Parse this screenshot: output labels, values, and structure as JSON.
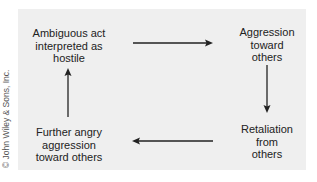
{
  "diagram": {
    "type": "cycle",
    "nodes": [
      {
        "id": "ambiguous",
        "lines": [
          "Ambiguous act",
          "interpreted as",
          "hostile"
        ]
      },
      {
        "id": "aggression",
        "lines": [
          "Aggression",
          "toward",
          "others"
        ]
      },
      {
        "id": "retaliation",
        "lines": [
          "Retaliation",
          "from",
          "others"
        ]
      },
      {
        "id": "further",
        "lines": [
          "Further angry",
          "aggression",
          "toward others"
        ]
      }
    ],
    "edges": [
      {
        "from": "ambiguous",
        "to": "aggression"
      },
      {
        "from": "aggression",
        "to": "retaliation"
      },
      {
        "from": "retaliation",
        "to": "further"
      },
      {
        "from": "further",
        "to": "ambiguous"
      }
    ]
  },
  "copyright": "© John Wiley & Sons, Inc.",
  "colors": {
    "panel": "#efefef",
    "text": "#222222",
    "arrow": "#222222"
  }
}
